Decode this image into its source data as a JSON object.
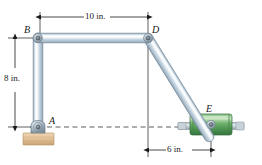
{
  "figure": {
    "background": "#ffffff"
  },
  "labels": {
    "point_a": "A",
    "point_b": "B",
    "point_d": "D",
    "point_e": "E"
  },
  "dimensions": {
    "horizontal_top": "10 in.",
    "vertical_left": "8 in.",
    "horizontal_bottom": "6 in."
  },
  "colors": {
    "bar_fill": "#c3d3e0",
    "bar_light": "#eef4f8",
    "bar_edge": "#8fa3b5",
    "bar_outline": "#5f7080",
    "collar_green": "#63a866",
    "collar_green_dark": "#3c7f45",
    "collar_green_light": "#a8d2a4",
    "rod_grey": "#cdd8dd",
    "rod_edge": "#8d9aa1",
    "support_tan": "#e3c29a",
    "support_tan_dark": "#c79f73",
    "pin_grey": "#9aa7b1",
    "pin_dark": "#4d5a64",
    "line_black": "#1a1a1a",
    "dash_line": "#333333"
  },
  "geometry": {
    "point_a": {
      "x": 38,
      "y": 127
    },
    "point_b": {
      "x": 38,
      "y": 38
    },
    "point_d": {
      "x": 148,
      "y": 38
    },
    "point_e": {
      "x": 211,
      "y": 124
    },
    "bar_width": 8,
    "note": "A is pinned to a fixed support block; E is a pin riding in a collar on a horizontal rod"
  },
  "elements": {
    "support_block": "fixed-support-block",
    "collar": "sliding-collar",
    "rod": "horizontal-guide-rod",
    "centerline": "horizontal-dashed-centerline"
  }
}
